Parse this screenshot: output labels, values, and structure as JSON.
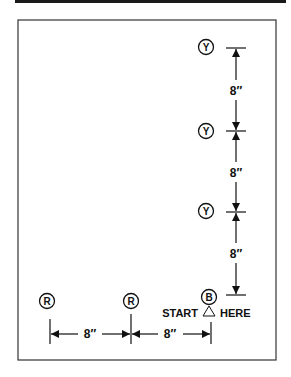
{
  "diagram": {
    "markers_yellow": [
      {
        "label": "Y",
        "x": 206,
        "y": 47
      },
      {
        "label": "Y",
        "x": 206,
        "y": 131
      },
      {
        "label": "Y",
        "x": 206,
        "y": 211
      }
    ],
    "marker_start": {
      "label": "B",
      "x": 209,
      "y": 297
    },
    "markers_red": [
      {
        "label": "R",
        "x": 47,
        "y": 301
      },
      {
        "label": "R",
        "x": 131,
        "y": 301
      }
    ],
    "start_text_left": "START",
    "start_symbol": "△",
    "start_text_right": "HERE",
    "vertical_dimensions": [
      "8″",
      "8″",
      "8″"
    ],
    "horizontal_dimensions": [
      "8″",
      "8″"
    ],
    "colors": {
      "line": "#111111",
      "frame": "#333333",
      "background": "#ffffff"
    }
  }
}
